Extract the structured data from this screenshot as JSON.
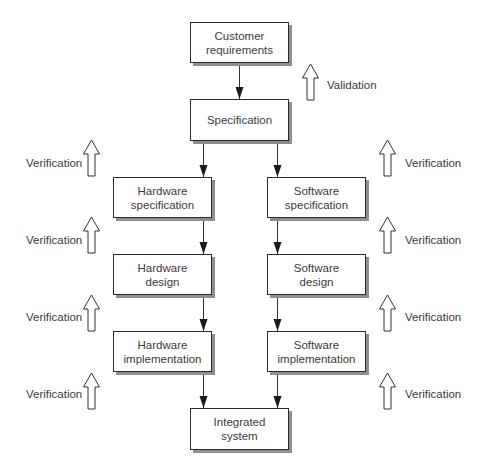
{
  "diagram": {
    "nodes": [
      {
        "id": "customer-requirements",
        "lines": [
          "Customer",
          "requirements"
        ],
        "x": 190,
        "y": 22,
        "w": 99,
        "h": 41
      },
      {
        "id": "specification",
        "lines": [
          "Specification"
        ],
        "x": 190,
        "y": 99,
        "w": 99,
        "h": 42
      },
      {
        "id": "hardware-specification",
        "lines": [
          "Hardware",
          "specification"
        ],
        "x": 113,
        "y": 177,
        "w": 99,
        "h": 41
      },
      {
        "id": "software-specification",
        "lines": [
          "Software",
          "specification"
        ],
        "x": 267,
        "y": 177,
        "w": 99,
        "h": 41
      },
      {
        "id": "hardware-design",
        "lines": [
          "Hardware",
          "design"
        ],
        "x": 113,
        "y": 254,
        "w": 99,
        "h": 41
      },
      {
        "id": "software-design",
        "lines": [
          "Software",
          "design"
        ],
        "x": 267,
        "y": 254,
        "w": 99,
        "h": 41
      },
      {
        "id": "hardware-implementation",
        "lines": [
          "Hardware",
          "implementation"
        ],
        "x": 113,
        "y": 331,
        "w": 99,
        "h": 41
      },
      {
        "id": "software-implementation",
        "lines": [
          "Software",
          "implementation"
        ],
        "x": 267,
        "y": 331,
        "w": 99,
        "h": 41
      },
      {
        "id": "integrated-system",
        "lines": [
          "Integrated",
          "system"
        ],
        "x": 190,
        "y": 408,
        "w": 99,
        "h": 42
      }
    ],
    "edges": [
      {
        "from": "customer-requirements",
        "to": "specification"
      },
      {
        "from": "specification",
        "to": "hardware-specification"
      },
      {
        "from": "specification",
        "to": "software-specification"
      },
      {
        "from": "hardware-specification",
        "to": "hardware-design"
      },
      {
        "from": "software-specification",
        "to": "software-design"
      },
      {
        "from": "hardware-design",
        "to": "hardware-implementation"
      },
      {
        "from": "software-design",
        "to": "software-implementation"
      },
      {
        "from": "hardware-implementation",
        "to": "integrated-system"
      },
      {
        "from": "software-implementation",
        "to": "integrated-system"
      }
    ],
    "validation": {
      "label": "Validation"
    },
    "verification": {
      "label": "Verification",
      "left_count": 4,
      "right_count": 4
    }
  }
}
